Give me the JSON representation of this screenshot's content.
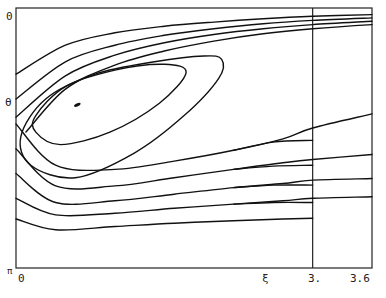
{
  "chart_data": {
    "type": "line",
    "title": "",
    "subtitle": "",
    "xlabel": "ξ",
    "ylabel": "θ",
    "xlim": [
      0,
      3.6
    ],
    "ylim": [
      0,
      3.1416
    ],
    "y_inverted": true,
    "grid": false,
    "legend": "none",
    "x_tick_labels": [
      "0",
      "ξ",
      "3.",
      "3.6"
    ],
    "x_tick_values": [
      0,
      2.72,
      3.0,
      3.6
    ],
    "y_tick_labels": [
      "0",
      "θ",
      "π"
    ],
    "y_tick_values": [
      0,
      1.2,
      3.1416
    ],
    "vertical_reference_line": {
      "x": 3.0
    },
    "critical_point": {
      "x": 0.62,
      "y": 1.17
    },
    "series": [
      {
        "name": "upper-1",
        "kind": "open",
        "x": [
          0,
          0.5,
          1.0,
          1.5,
          2.0,
          2.5,
          3.0,
          3.6
        ],
        "y": [
          0.8,
          0.45,
          0.3,
          0.22,
          0.17,
          0.13,
          0.1,
          0.08
        ]
      },
      {
        "name": "upper-2",
        "kind": "open",
        "x": [
          0,
          0.5,
          1.0,
          1.5,
          2.0,
          2.5,
          3.0,
          3.6
        ],
        "y": [
          1.1,
          0.65,
          0.45,
          0.33,
          0.25,
          0.19,
          0.15,
          0.12
        ]
      },
      {
        "name": "upper-3",
        "kind": "open",
        "x": [
          0,
          0.5,
          1.0,
          1.5,
          2.0,
          2.5,
          3.0,
          3.6
        ],
        "y": [
          1.32,
          0.82,
          0.57,
          0.42,
          0.32,
          0.25,
          0.2,
          0.16
        ]
      },
      {
        "name": "upper-4",
        "kind": "open",
        "x": [
          0.1,
          0.5,
          1.0,
          1.5,
          2.0,
          2.5,
          3.0,
          3.6
        ],
        "y": [
          1.5,
          0.98,
          0.69,
          0.52,
          0.4,
          0.31,
          0.25,
          0.2
        ]
      },
      {
        "name": "separatrix-loop",
        "kind": "closed",
        "x": [
          0.05,
          0.3,
          0.8,
          1.4,
          1.9,
          2.08,
          2.05,
          1.7,
          1.2,
          0.6,
          0.15
        ],
        "y": [
          1.55,
          1.1,
          0.8,
          0.65,
          0.58,
          0.62,
          0.85,
          1.3,
          1.75,
          2.05,
          1.9
        ]
      },
      {
        "name": "inner-orbit",
        "kind": "closed",
        "x": [
          0.2,
          0.5,
          1.0,
          1.5,
          1.72,
          1.45,
          0.95,
          0.45,
          0.2
        ],
        "y": [
          1.3,
          0.95,
          0.75,
          0.68,
          0.78,
          1.15,
          1.5,
          1.65,
          1.5
        ]
      },
      {
        "name": "lower-1",
        "kind": "open",
        "x": [
          0,
          0.4,
          1.0,
          1.6,
          2.2,
          2.7,
          3.0,
          3.6
        ],
        "y": [
          1.4,
          1.9,
          1.95,
          1.85,
          1.72,
          1.58,
          1.45,
          1.28
        ]
      },
      {
        "name": "lower-1b",
        "kind": "open",
        "x": [
          2.2,
          2.6,
          3.0
        ],
        "y": [
          1.72,
          1.62,
          1.6
        ]
      },
      {
        "name": "lower-2",
        "kind": "open",
        "x": [
          0,
          0.4,
          1.0,
          1.6,
          2.2,
          2.7,
          3.0,
          3.6
        ],
        "y": [
          1.7,
          2.15,
          2.15,
          2.05,
          1.95,
          1.87,
          1.83,
          1.77
        ]
      },
      {
        "name": "lower-2b",
        "kind": "open",
        "x": [
          2.2,
          2.6,
          3.0
        ],
        "y": [
          1.95,
          1.91,
          1.9
        ]
      },
      {
        "name": "lower-3",
        "kind": "open",
        "x": [
          0,
          0.4,
          1.0,
          1.6,
          2.2,
          2.7,
          3.0,
          3.6
        ],
        "y": [
          2.0,
          2.35,
          2.33,
          2.25,
          2.17,
          2.12,
          2.08,
          2.06
        ]
      },
      {
        "name": "lower-3b",
        "kind": "open",
        "x": [
          2.2,
          2.6,
          3.0
        ],
        "y": [
          2.17,
          2.14,
          2.14
        ]
      },
      {
        "name": "lower-4",
        "kind": "open",
        "x": [
          0,
          0.4,
          1.0,
          1.6,
          2.2,
          2.7,
          3.0,
          3.6
        ],
        "y": [
          2.3,
          2.5,
          2.48,
          2.42,
          2.37,
          2.33,
          2.3,
          2.28
        ]
      },
      {
        "name": "lower-4b",
        "kind": "open",
        "x": [
          2.2,
          2.6,
          3.0
        ],
        "y": [
          2.37,
          2.35,
          2.35
        ]
      },
      {
        "name": "lower-5",
        "kind": "open",
        "x": [
          0,
          0.4,
          1.0,
          1.6,
          2.2,
          2.7,
          3.0
        ],
        "y": [
          2.55,
          2.68,
          2.64,
          2.6,
          2.57,
          2.55,
          2.54
        ]
      }
    ]
  }
}
